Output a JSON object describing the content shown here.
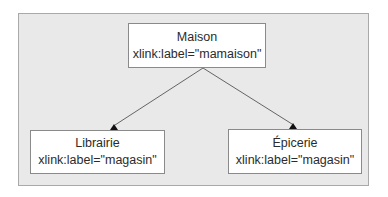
{
  "diagram": {
    "type": "tree",
    "colors": {
      "frame_background": "#e9e9e9",
      "frame_border": "#a9a9a9",
      "node_background": "#ffffff",
      "node_border": "#8a8a8a",
      "edge": "#555555",
      "text": "#2b2b2b"
    },
    "nodes": [
      {
        "id": "maison",
        "title": "Maison",
        "attribute": "xlink:label=\"mamaison\""
      },
      {
        "id": "librairie",
        "title": "Librairie",
        "attribute": "xlink:label=\"magasin\""
      },
      {
        "id": "epicerie",
        "title": "Épicerie",
        "attribute": "xlink:label=\"magasin\""
      }
    ],
    "edges": [
      {
        "from": "maison",
        "to": "librairie",
        "arrowhead": "filled-triangle"
      },
      {
        "from": "maison",
        "to": "epicerie",
        "arrowhead": "filled-triangle"
      }
    ]
  }
}
